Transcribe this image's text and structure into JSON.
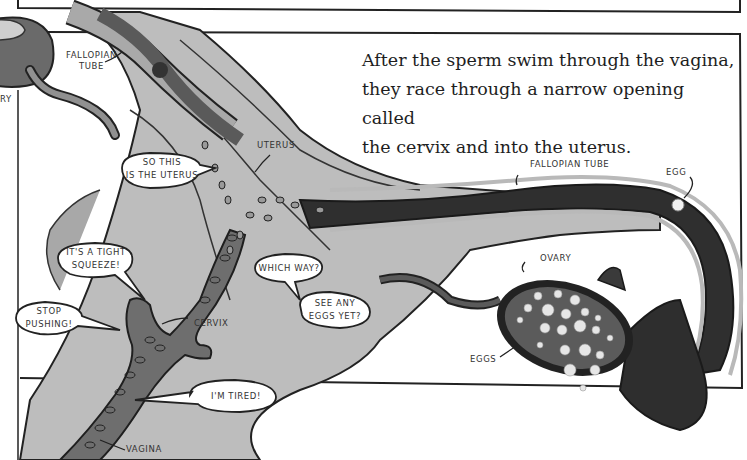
{
  "caption": {
    "lines": [
      "After the sperm swim through the vagina,",
      "they race through a narrow opening called",
      "the cervix and into the uterus."
    ]
  },
  "labels": {
    "fallopian_tube_left": [
      "Fallopian",
      "Tube"
    ],
    "ovary_left_partial": "ry",
    "uterus": "Uterus",
    "fallopian_tube_right": "Fallopian Tube",
    "egg": "Egg",
    "ovary": "Ovary",
    "eggs": "Eggs",
    "cervix": "Cervix",
    "vagina": "Vagina"
  },
  "speech_bubbles": [
    {
      "id": "so-this-is-the-uterus",
      "lines": [
        "So this",
        "is the uterus"
      ]
    },
    {
      "id": "tight-squeeze",
      "lines": [
        "It's a tight",
        "squeeze!"
      ]
    },
    {
      "id": "stop-pushing",
      "lines": [
        "Stop",
        "pushing!"
      ]
    },
    {
      "id": "which-way",
      "lines": [
        "Which way?"
      ]
    },
    {
      "id": "see-any-eggs",
      "lines": [
        "See any",
        "eggs yet?"
      ]
    },
    {
      "id": "im-tired",
      "lines": [
        "I'm tired!"
      ]
    }
  ],
  "colors": {
    "tissue_light": "#b9b9b9",
    "tissue_mid": "#8e8e8e",
    "tube_dark": "#3a3a3a",
    "outline": "#1f1f1f",
    "background": "#ffffff"
  }
}
